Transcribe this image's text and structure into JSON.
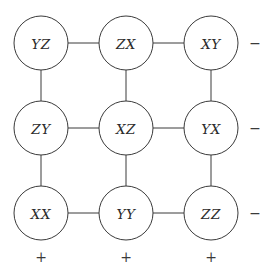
{
  "diagram": {
    "type": "grid-graph",
    "width": 272,
    "height": 279,
    "background_color": "#ffffff",
    "stroke_color": "#3a3a3a",
    "label_color": "#2b2b2b",
    "node_radius": 27,
    "column_x": [
      41,
      126,
      211
    ],
    "row_y": [
      43,
      128,
      213
    ],
    "nodes": [
      {
        "id": "n00",
        "label": "YZ",
        "row": 0,
        "col": 0,
        "cx": 41,
        "cy": 43
      },
      {
        "id": "n01",
        "label": "ZX",
        "row": 0,
        "col": 1,
        "cx": 126,
        "cy": 43
      },
      {
        "id": "n02",
        "label": "XY",
        "row": 0,
        "col": 2,
        "cx": 211,
        "cy": 43
      },
      {
        "id": "n10",
        "label": "ZY",
        "row": 1,
        "col": 0,
        "cx": 41,
        "cy": 128
      },
      {
        "id": "n11",
        "label": "XZ",
        "row": 1,
        "col": 1,
        "cx": 126,
        "cy": 128
      },
      {
        "id": "n12",
        "label": "YX",
        "row": 1,
        "col": 2,
        "cx": 211,
        "cy": 128
      },
      {
        "id": "n20",
        "label": "XX",
        "row": 2,
        "col": 0,
        "cx": 41,
        "cy": 213
      },
      {
        "id": "n21",
        "label": "YY",
        "row": 2,
        "col": 1,
        "cx": 126,
        "cy": 213
      },
      {
        "id": "n22",
        "label": "ZZ",
        "row": 2,
        "col": 2,
        "cx": 211,
        "cy": 213
      }
    ],
    "edges": [
      {
        "from": "n00",
        "to": "n01",
        "orientation": "horizontal"
      },
      {
        "from": "n01",
        "to": "n02",
        "orientation": "horizontal"
      },
      {
        "from": "n10",
        "to": "n11",
        "orientation": "horizontal"
      },
      {
        "from": "n11",
        "to": "n12",
        "orientation": "horizontal"
      },
      {
        "from": "n20",
        "to": "n21",
        "orientation": "horizontal"
      },
      {
        "from": "n21",
        "to": "n22",
        "orientation": "horizontal"
      },
      {
        "from": "n00",
        "to": "n10",
        "orientation": "vertical"
      },
      {
        "from": "n01",
        "to": "n11",
        "orientation": "vertical"
      },
      {
        "from": "n02",
        "to": "n12",
        "orientation": "vertical"
      },
      {
        "from": "n10",
        "to": "n20",
        "orientation": "vertical"
      },
      {
        "from": "n11",
        "to": "n21",
        "orientation": "vertical"
      },
      {
        "from": "n12",
        "to": "n22",
        "orientation": "vertical"
      }
    ],
    "row_signs": [
      {
        "row": 0,
        "sign": "−",
        "x": 255,
        "y": 43
      },
      {
        "row": 1,
        "sign": "−",
        "x": 255,
        "y": 128
      },
      {
        "row": 2,
        "sign": "−",
        "x": 255,
        "y": 213
      }
    ],
    "column_signs": [
      {
        "col": 0,
        "sign": "+",
        "x": 41,
        "y": 257
      },
      {
        "col": 1,
        "sign": "+",
        "x": 126,
        "y": 257
      },
      {
        "col": 2,
        "sign": "+",
        "x": 211,
        "y": 257
      }
    ]
  }
}
